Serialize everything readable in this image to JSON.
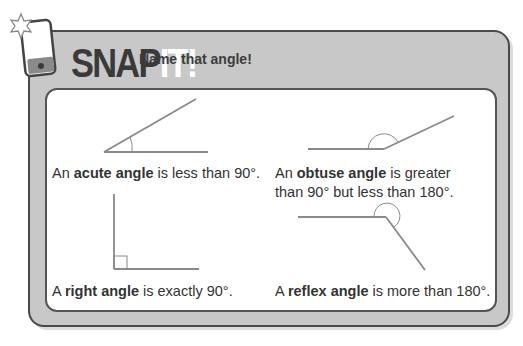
{
  "header": {
    "title_main": "SNAP",
    "title_highlight": "IT!",
    "subtitle": "Name that angle!"
  },
  "icons": {
    "phone": "phone-icon",
    "star": "star-flash-icon"
  },
  "angles": [
    {
      "pre": "An ",
      "term": "acute angle",
      "post": " is less than 90°."
    },
    {
      "pre": "An ",
      "term": "obtuse angle",
      "post": " is greater",
      "line2": "than 90° but less than 180°."
    },
    {
      "pre": "A ",
      "term": "right angle",
      "post": " is exactly 90°."
    },
    {
      "pre": "A ",
      "term": "reflex angle",
      "post": " is more than 180°."
    }
  ],
  "colors": {
    "panel_gray": "#c8c8c8",
    "border_dark": "#4a4a4a",
    "line_gray": "#8a8a8a"
  }
}
